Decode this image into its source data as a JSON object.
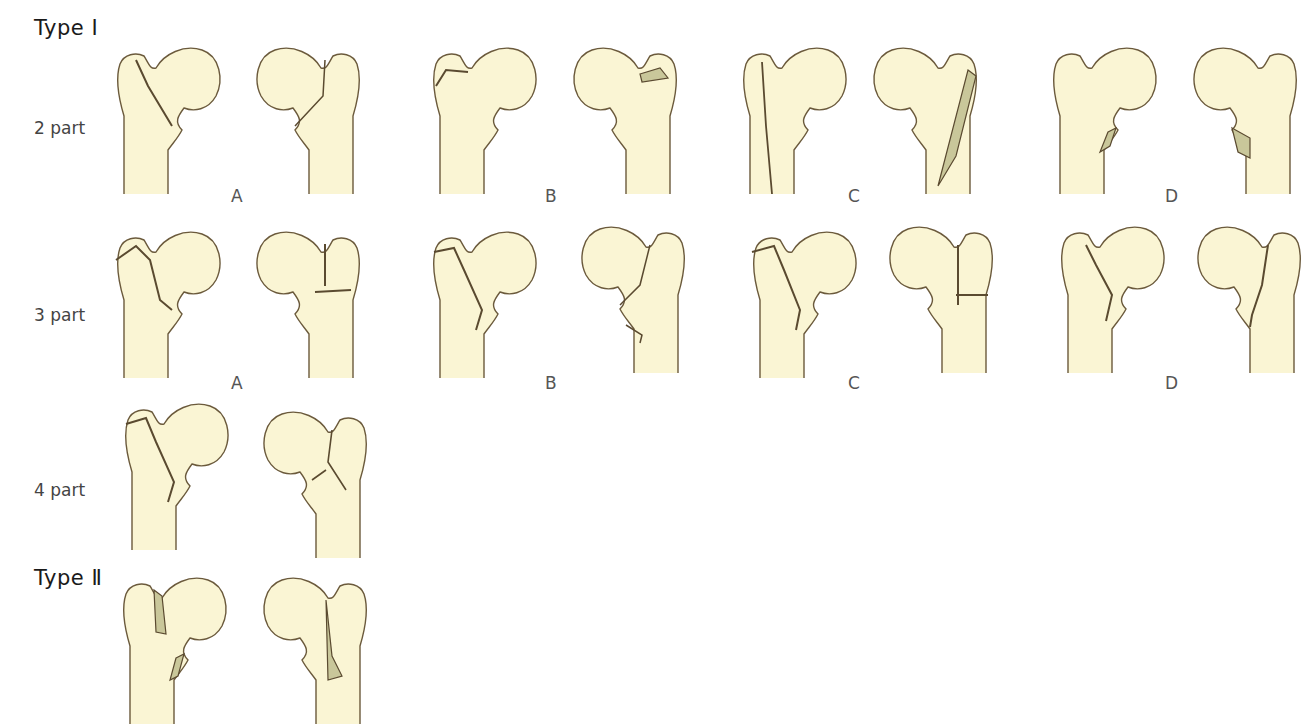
{
  "figure": {
    "colors": {
      "bone_fill": "#faf5d4",
      "outline": "#6b5a3c",
      "fracture": "#5a4a30",
      "fragment_fill": "#c9c79a"
    },
    "types": [
      {
        "label": "Type Ⅰ"
      },
      {
        "label": "Type Ⅱ"
      }
    ],
    "rows": [
      {
        "label": "2 part",
        "groups": [
          "A",
          "B",
          "C",
          "D"
        ]
      },
      {
        "label": "3 part",
        "groups": [
          "A",
          "B",
          "C",
          "D"
        ]
      },
      {
        "label": "4 part",
        "groups": []
      }
    ]
  }
}
